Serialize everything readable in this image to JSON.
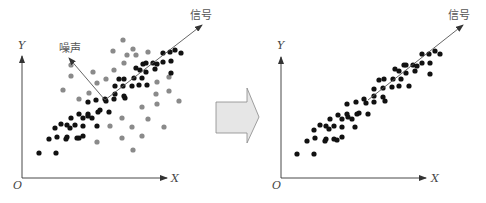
{
  "colors": {
    "signal_point": "#111111",
    "noise_point": "#8a8a8a",
    "axis": "#333333",
    "vector": "#555555",
    "block_arrow_fill": "#e6e6e6",
    "block_arrow_stroke": "#888888",
    "label": "#555555"
  },
  "left_panel": {
    "origin_label": "O",
    "x_axis_label": "X",
    "y_axis_label": "Y",
    "signal_label": "信号",
    "noise_label": "噪声",
    "signal_points": [
      [
        39,
        153
      ],
      [
        56,
        153
      ],
      [
        49,
        139
      ],
      [
        57,
        137
      ],
      [
        66,
        139
      ],
      [
        67,
        137
      ],
      [
        77,
        138
      ],
      [
        79,
        138
      ],
      [
        83,
        136
      ],
      [
        55,
        128
      ],
      [
        61,
        124
      ],
      [
        67,
        125
      ],
      [
        70,
        128
      ],
      [
        75,
        125
      ],
      [
        83,
        126
      ],
      [
        71,
        118
      ],
      [
        79,
        114
      ],
      [
        83,
        118
      ],
      [
        88,
        114
      ],
      [
        88,
        116
      ],
      [
        92,
        118
      ],
      [
        97,
        126
      ],
      [
        98,
        112
      ],
      [
        100,
        110
      ],
      [
        109,
        112
      ],
      [
        88,
        102
      ],
      [
        96,
        100
      ],
      [
        105,
        99
      ],
      [
        106,
        101
      ],
      [
        114,
        99
      ],
      [
        115,
        94
      ],
      [
        125,
        98
      ],
      [
        124,
        96
      ],
      [
        115,
        86
      ],
      [
        123,
        86
      ],
      [
        132,
        86
      ],
      [
        139,
        85
      ],
      [
        147,
        85
      ],
      [
        119,
        79
      ],
      [
        124,
        79
      ],
      [
        134,
        78
      ],
      [
        142,
        78
      ],
      [
        136,
        68
      ],
      [
        140,
        70
      ],
      [
        146,
        72
      ],
      [
        155,
        69
      ],
      [
        143,
        64
      ],
      [
        146,
        63
      ],
      [
        153,
        63
      ],
      [
        157,
        64
      ],
      [
        163,
        62
      ],
      [
        171,
        61
      ],
      [
        171,
        73
      ],
      [
        163,
        53
      ],
      [
        170,
        52
      ],
      [
        175,
        50
      ],
      [
        181,
        53
      ]
    ],
    "noise_points": [
      [
        123,
        40
      ],
      [
        113,
        51
      ],
      [
        133,
        49
      ],
      [
        127,
        55
      ],
      [
        136,
        55
      ],
      [
        148,
        52
      ],
      [
        124,
        63
      ],
      [
        71,
        65
      ],
      [
        71,
        76
      ],
      [
        93,
        72
      ],
      [
        114,
        70
      ],
      [
        106,
        79
      ],
      [
        97,
        83
      ],
      [
        63,
        90
      ],
      [
        79,
        99
      ],
      [
        89,
        93
      ],
      [
        157,
        82
      ],
      [
        169,
        77
      ],
      [
        156,
        94
      ],
      [
        169,
        91
      ],
      [
        157,
        104
      ],
      [
        179,
        101
      ],
      [
        142,
        107
      ],
      [
        122,
        118
      ],
      [
        148,
        119
      ],
      [
        110,
        126
      ],
      [
        132,
        127
      ],
      [
        164,
        127
      ],
      [
        122,
        138
      ],
      [
        142,
        136
      ],
      [
        97,
        142
      ],
      [
        133,
        150
      ]
    ]
  },
  "transition_arrow": {
    "icon": "right-block-arrow-icon"
  },
  "right_panel": {
    "origin_label": "O",
    "x_axis_label": "X",
    "y_axis_label": "Y",
    "signal_label": "信号",
    "signal_points": [
      [
        297,
        154
      ],
      [
        314,
        154
      ],
      [
        307,
        141
      ],
      [
        315,
        138
      ],
      [
        325,
        141
      ],
      [
        326,
        139
      ],
      [
        334,
        139
      ],
      [
        337,
        140
      ],
      [
        342,
        137
      ],
      [
        314,
        130
      ],
      [
        320,
        125
      ],
      [
        326,
        126
      ],
      [
        329,
        129
      ],
      [
        334,
        126
      ],
      [
        342,
        127
      ],
      [
        355,
        127
      ],
      [
        330,
        119
      ],
      [
        338,
        115
      ],
      [
        342,
        119
      ],
      [
        347,
        114
      ],
      [
        348,
        117
      ],
      [
        352,
        119
      ],
      [
        357,
        114
      ],
      [
        359,
        113
      ],
      [
        368,
        114
      ],
      [
        347,
        104
      ],
      [
        356,
        102
      ],
      [
        364,
        99
      ],
      [
        366,
        103
      ],
      [
        374,
        102
      ],
      [
        374,
        96
      ],
      [
        383,
        97
      ],
      [
        385,
        101
      ],
      [
        374,
        89
      ],
      [
        383,
        88
      ],
      [
        392,
        87
      ],
      [
        399,
        86
      ],
      [
        409,
        86
      ],
      [
        379,
        80
      ],
      [
        384,
        79
      ],
      [
        393,
        79
      ],
      [
        401,
        79
      ],
      [
        395,
        69
      ],
      [
        399,
        71
      ],
      [
        406,
        73
      ],
      [
        415,
        71
      ],
      [
        404,
        65
      ],
      [
        406,
        65
      ],
      [
        413,
        65
      ],
      [
        417,
        66
      ],
      [
        422,
        63
      ],
      [
        430,
        63
      ],
      [
        430,
        74
      ],
      [
        422,
        54
      ],
      [
        429,
        54
      ],
      [
        435,
        51
      ],
      [
        440,
        54
      ]
    ]
  }
}
